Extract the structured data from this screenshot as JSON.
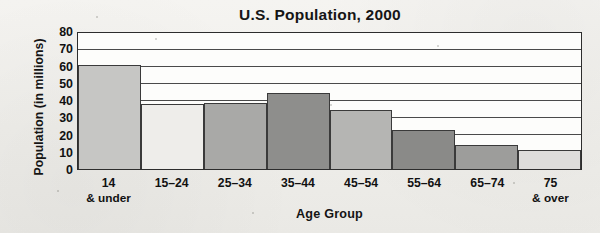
{
  "chart_data": {
    "type": "bar",
    "title": "U.S. Population, 2000",
    "xlabel": "Age Group",
    "ylabel": "Population (in millions)",
    "categories": [
      "14 & under",
      "15–24",
      "25–34",
      "35–44",
      "45–54",
      "55–64",
      "65–74",
      "75 & over"
    ],
    "category_lines": [
      [
        "14",
        "& under"
      ],
      [
        "15–24",
        ""
      ],
      [
        "25–34",
        ""
      ],
      [
        "35–44",
        ""
      ],
      [
        "45–54",
        ""
      ],
      [
        "55–64",
        ""
      ],
      [
        "65–74",
        ""
      ],
      [
        "75",
        "& over"
      ]
    ],
    "values": [
      61,
      38,
      39,
      45,
      35,
      23,
      14,
      11
    ],
    "bar_colors": [
      "#c6c6c4",
      "#eeedea",
      "#a9a9a7",
      "#8e8e8c",
      "#b5b5b3",
      "#8a8a88",
      "#9d9d9b",
      "#dedddb"
    ],
    "ylim": [
      0,
      80
    ],
    "ytick_values": [
      80,
      70,
      60,
      50,
      40,
      30,
      20,
      10,
      0
    ],
    "ytick_labels": [
      "80",
      "70",
      "60",
      "50",
      "40",
      "30",
      "20",
      "10",
      "0"
    ],
    "grid": true,
    "grid_axis": "y",
    "legend": "none",
    "units": "millions"
  }
}
